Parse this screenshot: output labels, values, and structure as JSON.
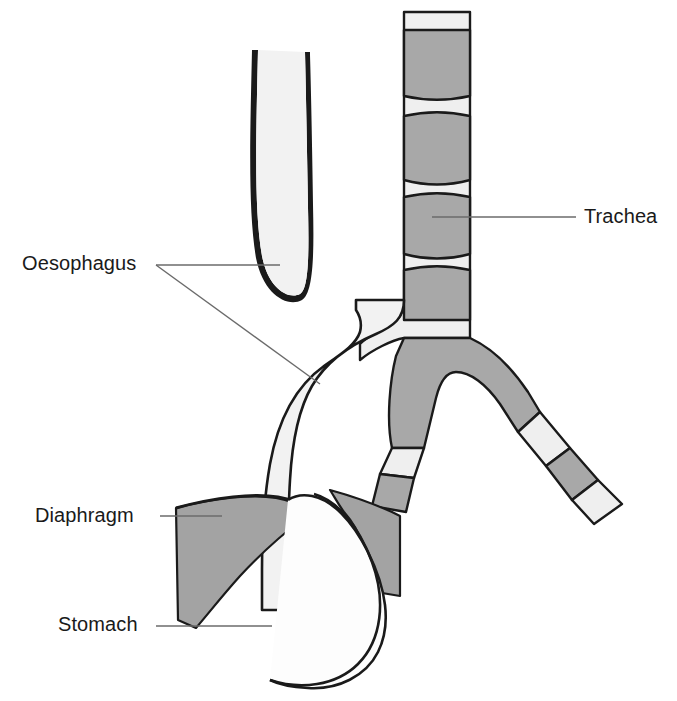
{
  "figure": {
    "type": "anatomical-line-diagram",
    "width": 677,
    "height": 701,
    "background": "#ffffff"
  },
  "labels": [
    {
      "id": "oesophagus",
      "text": "Oesophagus",
      "x": 22,
      "y": 252,
      "leader_count": 2
    },
    {
      "id": "trachea",
      "text": "Trachea",
      "x": 584,
      "y": 205,
      "leader_count": 1
    },
    {
      "id": "diaphragm",
      "text": "Diaphragm",
      "x": 35,
      "y": 504,
      "leader_count": 1
    },
    {
      "id": "stomach",
      "text": "Stomach",
      "x": 58,
      "y": 613,
      "leader_count": 1
    }
  ],
  "structures": [
    {
      "name": "upper-oesophageal-pouch",
      "fill": "#f2f2f2",
      "stroke": "#1a1a1a"
    },
    {
      "name": "trachea",
      "fill": "#efefef",
      "stroke": "#1a1a1a",
      "cartilage_rings": 4
    },
    {
      "name": "lower-oesophagus-fistula",
      "fill": "#f2f2f2",
      "stroke": "#1a1a1a"
    },
    {
      "name": "right-main-bronchus",
      "fill": "#efefef",
      "stroke": "#1a1a1a",
      "cartilage_rings": 2
    },
    {
      "name": "left-main-bronchus",
      "fill": "#efefef",
      "stroke": "#1a1a1a",
      "cartilage_rings": 2
    },
    {
      "name": "diaphragm-left-wing",
      "fill": "#a3a3a3",
      "stroke": "#1a1a1a"
    },
    {
      "name": "diaphragm-right-wing",
      "fill": "#a3a3a3",
      "stroke": "#1a1a1a"
    },
    {
      "name": "stomach",
      "fill": "#fdfdfd",
      "stroke": "#1a1a1a"
    }
  ],
  "colors": {
    "cartilage_gray": "#a8a8a8",
    "lumen_light": "#efefef",
    "tissue_light": "#f2f2f2",
    "diaphragm_gray": "#a3a3a3",
    "outline": "#1a1a1a",
    "leader_line": "#6b6b6b",
    "text": "#1a1a1a"
  }
}
